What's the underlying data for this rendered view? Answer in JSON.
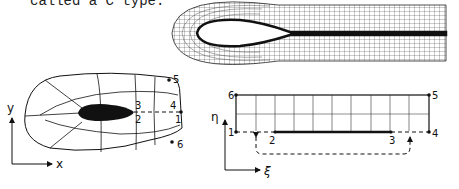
{
  "caption": "called a C type.",
  "physical_domain": {
    "axis_x": "x",
    "axis_y": "y",
    "points": [
      "1",
      "2",
      "3",
      "4",
      "5",
      "6"
    ]
  },
  "computational_domain": {
    "axis_xi": "ξ",
    "axis_eta": "η",
    "points": [
      "1",
      "2",
      "3",
      "4",
      "5",
      "6"
    ]
  }
}
